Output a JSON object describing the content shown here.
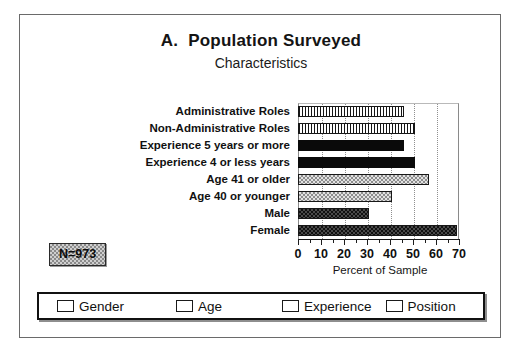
{
  "figure": {
    "title_letter": "A.",
    "title": "Population Surveyed",
    "subtitle": "Characteristics",
    "sample_note": "N=973"
  },
  "chart_data": {
    "type": "bar",
    "orientation": "horizontal",
    "subtitle": "Characteristics",
    "xlabel": "Percent of Sample",
    "ylabel": "",
    "xlim": [
      0,
      70
    ],
    "xticks": [
      0,
      10,
      20,
      30,
      40,
      50,
      60,
      70
    ],
    "xtick_labels": [
      "0",
      "10",
      "20",
      "30",
      "40",
      "50",
      "60",
      "70"
    ],
    "minor_tick_step": 5,
    "grid": "vertical",
    "legend_position": "bottom",
    "categories": [
      "Administrative Roles",
      "Non-Administrative Roles",
      "Experience 5 years or more",
      "Experience 4 or less years",
      "Age 41 or older",
      "Age 40 or younger",
      "Male",
      "Female"
    ],
    "values": [
      46,
      51,
      46,
      51,
      57,
      41,
      31,
      69
    ],
    "groups": [
      "Position",
      "Position",
      "Experience",
      "Experience",
      "Age",
      "Age",
      "Gender",
      "Gender"
    ],
    "series": [
      {
        "name": "Position",
        "pattern": "vertical-stripes",
        "points": [
          {
            "category": "Administrative Roles",
            "value": 46
          },
          {
            "category": "Non-Administrative Roles",
            "value": 51
          }
        ]
      },
      {
        "name": "Experience",
        "pattern": "solid-black",
        "points": [
          {
            "category": "Experience 5 years or more",
            "value": 46
          },
          {
            "category": "Experience 4 or less years",
            "value": 51
          }
        ]
      },
      {
        "name": "Age",
        "pattern": "light-checker",
        "points": [
          {
            "category": "Age 41 or older",
            "value": 57
          },
          {
            "category": "Age 40 or younger",
            "value": 41
          }
        ]
      },
      {
        "name": "Gender",
        "pattern": "dark-checker",
        "points": [
          {
            "category": "Male",
            "value": 31
          },
          {
            "category": "Female",
            "value": 69
          }
        ]
      }
    ]
  },
  "legend": {
    "items": [
      {
        "label": "Gender",
        "pattern": "dark-checker"
      },
      {
        "label": "Age",
        "pattern": "light-checker"
      },
      {
        "label": "Experience",
        "pattern": "solid-black"
      },
      {
        "label": "Position",
        "pattern": "vertical-stripes"
      }
    ]
  },
  "colors": {
    "frame_border": "#6a6a6a",
    "text": "#111111",
    "bar_black": "#0a0a0a",
    "bar_dark_checker": "#4a4a4a",
    "bar_light_checker": "#e2e2e2",
    "grid": "#9a9a9a",
    "n_box_fill": "#cfcfcf"
  }
}
